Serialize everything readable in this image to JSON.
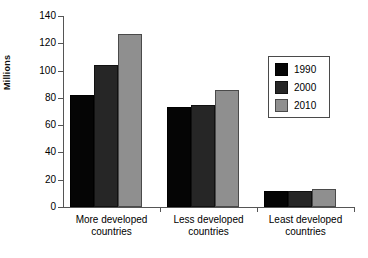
{
  "chart_data": {
    "type": "bar",
    "title": "",
    "xlabel": "",
    "ylabel": "Millions",
    "ylim": [
      0,
      140
    ],
    "yticks": [
      0,
      20,
      40,
      60,
      80,
      100,
      120,
      140
    ],
    "ytick_labels": [
      "0",
      "20",
      "40",
      "60",
      "80",
      "100",
      "120",
      "140"
    ],
    "grid": false,
    "legend_position": "upper right",
    "categories": [
      "More developed countries",
      "Less developed countries",
      "Least developed countries"
    ],
    "category_lines": [
      [
        "More developed",
        "countries"
      ],
      [
        "Less developed",
        "countries"
      ],
      [
        "Least developed",
        "countries"
      ]
    ],
    "series": [
      {
        "name": "1990",
        "color": "#050505",
        "values": [
          82,
          73,
          12
        ]
      },
      {
        "name": "2000",
        "color": "#262626",
        "values": [
          104,
          75,
          12
        ]
      },
      {
        "name": "2010",
        "color": "#8f8f8f",
        "values": [
          127,
          86,
          13
        ]
      }
    ]
  },
  "legend": {
    "items": [
      {
        "label": "1990"
      },
      {
        "label": "2000"
      },
      {
        "label": "2010"
      }
    ]
  },
  "axis": {
    "y_title": "Millions"
  }
}
